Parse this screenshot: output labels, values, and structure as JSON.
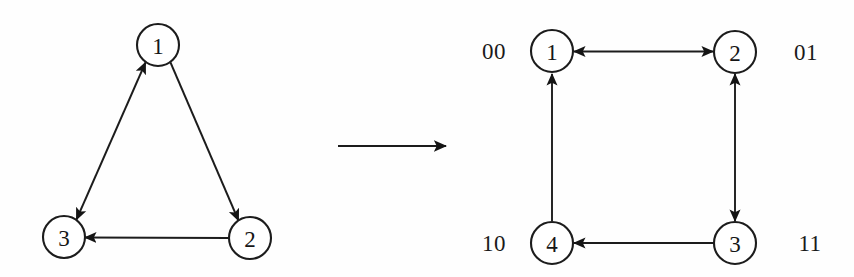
{
  "figure": {
    "background_color": "#fefefe",
    "ink_color": "#1a1a1a"
  },
  "left_graph": {
    "name": "source-graph",
    "node_radius": 21,
    "nodes": [
      {
        "id": "L1",
        "label": "1",
        "cx": 158,
        "cy": 45
      },
      {
        "id": "L2",
        "label": "2",
        "cx": 250,
        "cy": 238
      },
      {
        "id": "L3",
        "label": "3",
        "cx": 64,
        "cy": 237
      }
    ],
    "edges": [
      {
        "from": "L1",
        "to": "L2",
        "arrow": "forward",
        "description": "1 to 2"
      },
      {
        "from": "L2",
        "to": "L3",
        "arrow": "forward",
        "description": "2 to 3"
      },
      {
        "from": "L1",
        "to": "L3",
        "arrow": "both",
        "description": "1 and 3 bidirectional"
      }
    ]
  },
  "transform_arrow": {
    "name": "transformation-arrow",
    "x1": 338,
    "y1": 146,
    "x2": 449,
    "y2": 146,
    "direction": "right"
  },
  "right_graph": {
    "name": "result-graph",
    "node_radius": 21,
    "nodes": [
      {
        "id": "R1",
        "label": "1",
        "cx": 552,
        "cy": 51,
        "code": "00",
        "code_x": 494,
        "code_y": 51
      },
      {
        "id": "R2",
        "label": "2",
        "cx": 735,
        "cy": 52,
        "code": "01",
        "code_x": 806,
        "code_y": 52
      },
      {
        "id": "R3",
        "label": "3",
        "cx": 735,
        "cy": 243,
        "code": "11",
        "code_x": 810,
        "code_y": 243
      },
      {
        "id": "R4",
        "label": "4",
        "cx": 552,
        "cy": 243,
        "code": "10",
        "code_x": 494,
        "code_y": 243
      }
    ],
    "edges": [
      {
        "from": "R1",
        "to": "R2",
        "arrow": "both",
        "description": "1 and 2 bidirectional top"
      },
      {
        "from": "R2",
        "to": "R3",
        "arrow": "both",
        "description": "2 and 3 bidirectional right"
      },
      {
        "from": "R3",
        "to": "R4",
        "arrow": "forward",
        "description": "3 to 4 bottom"
      },
      {
        "from": "R4",
        "to": "R1",
        "arrow": "forward",
        "description": "4 to 1 left"
      }
    ],
    "codes": [
      "00",
      "01",
      "10",
      "11"
    ]
  }
}
